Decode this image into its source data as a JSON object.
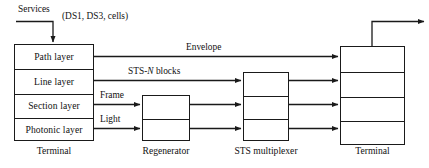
{
  "diagram": {
    "title_nodes": {
      "terminal_left": "Terminal",
      "regenerator": "Regenerator",
      "sts_multiplexer": "STS multiplexer",
      "terminal_right": "Terminal"
    },
    "left_terminal_layers": [
      "Path layer",
      "Line layer",
      "Section layer",
      "Photonic layer"
    ],
    "input": {
      "services_label": "Services",
      "services_detail": "(DS1, DS3, cells)"
    },
    "link_labels": {
      "envelope": "Envelope",
      "sts_blocks_prefix": "STS-",
      "sts_blocks_italic": "N",
      "sts_blocks_suffix": " blocks",
      "frame": "Frame",
      "light": "Light"
    },
    "colors": {
      "stroke": "#1a1a1a",
      "text": "#111111",
      "background": "#ffffff"
    }
  }
}
